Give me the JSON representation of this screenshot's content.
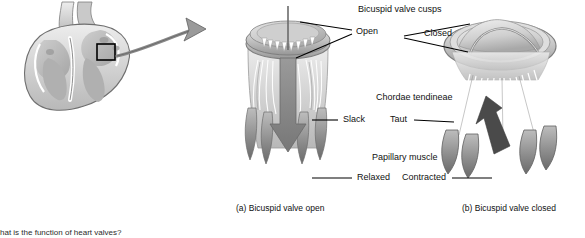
{
  "figure": {
    "title_absent": "",
    "background": "#ffffff",
    "ink": "#111111"
  },
  "panels": [
    {
      "id": "a",
      "caption": "(a) Bicuspid valve open"
    },
    {
      "id": "b",
      "caption": "(b) Bicuspid valve closed"
    }
  ],
  "labels": {
    "cusps_group": "Bicuspid valve cusps",
    "cusps_open": "Open",
    "cusps_closed": "Closed",
    "chordae_group": "Chordae tendineae",
    "chordae_slack": "Slack",
    "chordae_taut": "Taut",
    "papillary_group": "Papillary muscle",
    "papillary_relaxed": "Relaxed",
    "papillary_contracted": "Contracted"
  },
  "footer": {
    "clipped_question": "hat is the function of heart valves?"
  },
  "colors": {
    "tissue_light": "#d8d8d8",
    "tissue_mid": "#b4b4b4",
    "tissue_dark": "#8e8e8e",
    "tissue_darker": "#6f6f6f",
    "arrow_gray": "#8a8a8a",
    "arrow_dark": "#4d4d4d",
    "outline": "#4a4a4a",
    "leader": "#000000",
    "callout_box": "#000000"
  },
  "icons": {
    "heart_section": "heart-cross-section-icon",
    "zoom_arrow": "curved-zoom-arrow-icon",
    "flow_arrow_down": "blood-flow-down-arrow-icon",
    "flow_arrow_closed": "blood-flow-blocked-arrow-icon",
    "callout": "callout-box-icon"
  }
}
